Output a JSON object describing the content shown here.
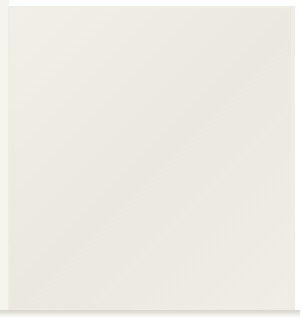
{
  "app": {
    "title": "Go Board Diagram",
    "type": "go-game-diagram"
  },
  "board": {
    "description": "Go board partial view, upper-left joseki sequence",
    "columns": 20,
    "rows": 21,
    "origin_x": 15.5,
    "origin_y": 16,
    "spacing": 13.15,
    "line_color": "#2a2723",
    "edge_color": "#17150f",
    "board_color": "#efece4",
    "paper_color": "#f1efe7"
  },
  "star_points": [
    {
      "col": 3,
      "row": 3
    },
    {
      "col": 3,
      "row": 11
    },
    {
      "col": 10,
      "row": 3
    },
    {
      "col": 10,
      "row": 11
    },
    {
      "col": 17,
      "row": 3
    },
    {
      "col": 17,
      "row": 11
    }
  ],
  "stones": [
    {
      "id": "w-a",
      "color": "white",
      "col": 2,
      "row": 1,
      "label": ""
    },
    {
      "id": "b-2",
      "color": "black",
      "col": 3,
      "row": 1,
      "label": "2"
    },
    {
      "id": "b-a",
      "color": "black",
      "col": 1,
      "row": 2,
      "label": ""
    },
    {
      "id": "b-b",
      "color": "black",
      "col": 2,
      "row": 2,
      "label": ""
    },
    {
      "id": "w-b",
      "color": "white",
      "col": 3,
      "row": 2,
      "label": ""
    },
    {
      "id": "b-c",
      "color": "black",
      "col": 6,
      "row": 2,
      "label": ""
    },
    {
      "id": "w-c",
      "color": "white",
      "col": 8,
      "row": 2,
      "label": ""
    },
    {
      "id": "b-d",
      "color": "black",
      "col": 17,
      "row": 3,
      "label": ""
    },
    {
      "id": "w-d",
      "color": "white",
      "col": 2,
      "row": 3,
      "label": ""
    },
    {
      "id": "b-e",
      "color": "black",
      "col": 3,
      "row": 3,
      "label": ""
    },
    {
      "id": "w-1",
      "color": "white",
      "col": 4,
      "row": 3,
      "label": "1"
    },
    {
      "id": "w-3",
      "color": "white",
      "col": 3,
      "row": 4,
      "label": "3"
    },
    {
      "id": "w-e",
      "color": "white",
      "col": 3,
      "row": 18,
      "label": ""
    },
    {
      "id": "b-f",
      "color": "black",
      "col": 17,
      "row": 18,
      "label": ""
    }
  ],
  "move_labels": {
    "one": "1",
    "two": "2",
    "three": "3"
  },
  "colors": {
    "black_stone": "#17150f",
    "white_stone": "#f7f5ef",
    "grid": "#2a2723",
    "background": "#ffffff"
  }
}
